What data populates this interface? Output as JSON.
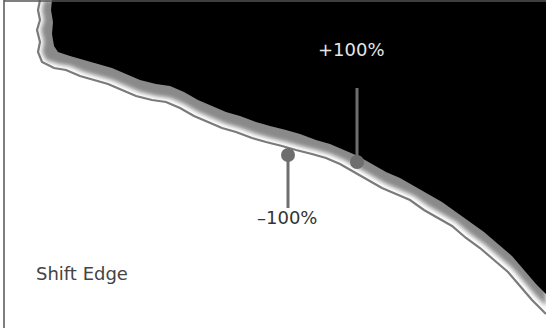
{
  "diagram": {
    "caption": "Shift Edge",
    "markers": [
      {
        "label": "+100%",
        "position": "outside-edge"
      },
      {
        "label": "–100%",
        "position": "inside-edge"
      }
    ],
    "colors": {
      "mask_fill": "#000000",
      "background": "#ffffff",
      "edge_outline": "#808080",
      "marker": "#6e6e6e",
      "plus_label": "#e6e6e6",
      "minus_label": "#333333",
      "frame_border": "#555555"
    }
  }
}
